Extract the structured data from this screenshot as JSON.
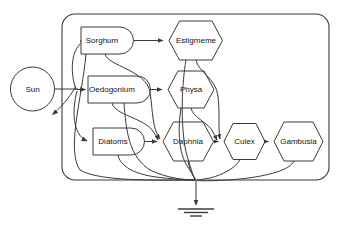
{
  "diagram": {
    "type": "energy-flow-food-web",
    "colors": {
      "stroke": "#3a3a3a",
      "fill": "#ffffff",
      "text": "#111111",
      "background": "#ffffff"
    },
    "external_source": {
      "label": "Sun",
      "shape": "circle",
      "position": "outside-left"
    },
    "boundary": {
      "shape": "rounded-rectangle",
      "label": "system-boundary"
    },
    "sink": {
      "label": "ground-sink-symbol",
      "shape": "heat-sink-ground",
      "bars": 3
    },
    "producers": [
      {
        "id": "sorghum",
        "label": "Sorghum",
        "shape": "d-shape-tank"
      },
      {
        "id": "oedogonium",
        "label": "Oedogonium",
        "shape": "d-shape-tank"
      },
      {
        "id": "diatoms",
        "label": "Diatoms",
        "shape": "d-shape-tank"
      }
    ],
    "consumers": [
      {
        "id": "estigmeme",
        "label": "Estigmeme",
        "shape": "hexagon"
      },
      {
        "id": "physa",
        "label": "Physa",
        "shape": "hexagon"
      },
      {
        "id": "daphnia",
        "label": "Daphnia",
        "shape": "hexagon"
      },
      {
        "id": "culex",
        "label": "Culex",
        "shape": "hexagon"
      },
      {
        "id": "gambusia",
        "label": "Gambusia",
        "shape": "hexagon"
      }
    ],
    "flows": [
      {
        "from": "sun",
        "to": "sorghum"
      },
      {
        "from": "sun",
        "to": "oedogonium"
      },
      {
        "from": "sun",
        "to": "diatoms"
      },
      {
        "from": "sun",
        "to": "reflected-energy-loss"
      },
      {
        "from": "sorghum",
        "to": "estigmeme"
      },
      {
        "from": "sorghum",
        "to": "daphnia"
      },
      {
        "from": "oedogonium",
        "to": "physa"
      },
      {
        "from": "oedogonium",
        "to": "daphnia"
      },
      {
        "from": "diatoms",
        "to": "daphnia"
      },
      {
        "from": "estigmeme",
        "to": "culex"
      },
      {
        "from": "physa",
        "to": "culex"
      },
      {
        "from": "daphnia",
        "to": "culex"
      },
      {
        "from": "culex",
        "to": "gambusia"
      },
      {
        "from": "sorghum",
        "to": "heat-sink"
      },
      {
        "from": "oedogonium",
        "to": "heat-sink"
      },
      {
        "from": "diatoms",
        "to": "heat-sink"
      },
      {
        "from": "estigmeme",
        "to": "heat-sink"
      },
      {
        "from": "physa",
        "to": "heat-sink"
      },
      {
        "from": "daphnia",
        "to": "heat-sink"
      },
      {
        "from": "culex",
        "to": "heat-sink"
      },
      {
        "from": "gambusia",
        "to": "heat-sink"
      }
    ]
  }
}
